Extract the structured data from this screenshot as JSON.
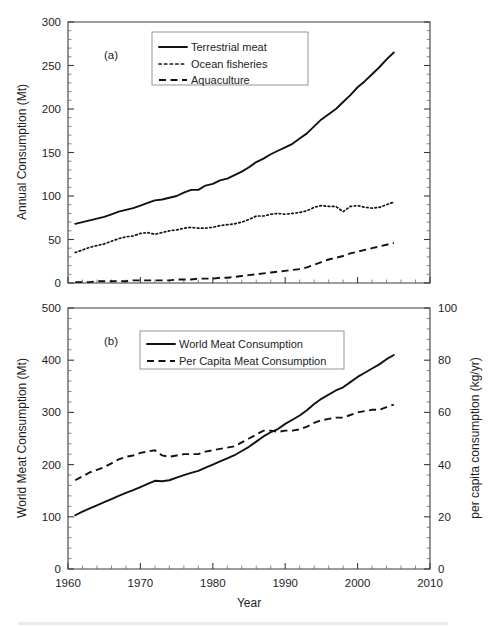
{
  "figure": {
    "width": 493,
    "height": 626,
    "background": "#ffffff",
    "ink_color": "#111111",
    "axis_color": "#3b3b3b"
  },
  "chart_data": [
    {
      "type": "line",
      "panel_label": "(a)",
      "title": "",
      "xlabel": "",
      "ylabel": "Annual Consumption (Mt)",
      "xlim": [
        1960,
        2010
      ],
      "ylim": [
        0,
        300
      ],
      "yticks": [
        0,
        50,
        100,
        150,
        200,
        250,
        300
      ],
      "ytick_labels": [
        "0",
        "50",
        "100",
        "150",
        "200",
        "250",
        "300"
      ],
      "xticks": [
        1960,
        1970,
        1980,
        1990,
        2000,
        2010
      ],
      "xtick_labels": [
        "",
        "",
        "",
        "",
        "",
        ""
      ],
      "minor_ticks": true,
      "grid": false,
      "legend_position": "upper-left-inset",
      "x": [
        1961,
        1962,
        1963,
        1964,
        1965,
        1966,
        1967,
        1968,
        1969,
        1970,
        1971,
        1972,
        1973,
        1974,
        1975,
        1976,
        1977,
        1978,
        1979,
        1980,
        1981,
        1982,
        1983,
        1984,
        1985,
        1986,
        1987,
        1988,
        1989,
        1990,
        1991,
        1992,
        1993,
        1994,
        1995,
        1996,
        1997,
        1998,
        1999,
        2000,
        2001,
        2002,
        2003,
        2004,
        2005
      ],
      "series": [
        {
          "name": "Terrestrial meat",
          "style": "solid",
          "values": [
            68,
            70,
            72,
            74,
            76,
            79,
            82,
            84,
            86,
            89,
            92,
            95,
            96,
            98,
            100,
            104,
            107,
            107,
            112,
            114,
            118,
            120,
            124,
            128,
            133,
            139,
            143,
            148,
            152,
            156,
            160,
            166,
            172,
            180,
            188,
            194,
            200,
            208,
            216,
            225,
            232,
            240,
            248,
            257,
            265
          ]
        },
        {
          "name": "Ocean fisheries",
          "style": "dotted",
          "values": [
            35,
            38,
            41,
            43,
            45,
            48,
            51,
            53,
            54,
            57,
            58,
            56,
            58,
            60,
            61,
            63,
            64,
            63,
            63,
            64,
            66,
            67,
            68,
            70,
            73,
            77,
            77,
            79,
            80,
            79,
            80,
            81,
            83,
            87,
            89,
            88,
            88,
            82,
            88,
            89,
            87,
            86,
            87,
            90,
            93
          ]
        },
        {
          "name": "Aquaculture",
          "style": "dashed",
          "values": [
            1,
            1,
            1,
            2,
            2,
            2,
            2,
            2,
            3,
            3,
            3,
            3,
            3,
            3,
            4,
            4,
            4,
            5,
            5,
            5,
            6,
            6,
            7,
            8,
            9,
            10,
            11,
            12,
            13,
            14,
            15,
            16,
            18,
            21,
            24,
            27,
            29,
            31,
            34,
            36,
            38,
            40,
            42,
            44,
            46
          ]
        }
      ]
    },
    {
      "type": "line",
      "panel_label": "(b)",
      "title": "",
      "xlabel": "Year",
      "ylabel": "World Meat Consumption (Mt)",
      "ylabel_right": "per capita consumption (kg/yr)",
      "xlim": [
        1960,
        2010
      ],
      "ylim": [
        0,
        500
      ],
      "ylim_right": [
        0,
        100
      ],
      "yticks": [
        0,
        100,
        200,
        300,
        400,
        500
      ],
      "ytick_labels": [
        "0",
        "100",
        "200",
        "300",
        "400",
        "500"
      ],
      "yticks_right": [
        0,
        20,
        40,
        60,
        80,
        100
      ],
      "ytick_labels_right": [
        "0",
        "20",
        "40",
        "60",
        "80",
        "100"
      ],
      "xticks": [
        1960,
        1970,
        1980,
        1990,
        2000,
        2010
      ],
      "xtick_labels": [
        "1960",
        "1970",
        "1980",
        "1990",
        "2000",
        "2010"
      ],
      "minor_ticks": true,
      "grid": false,
      "legend_position": "upper-center-inset",
      "x": [
        1961,
        1962,
        1963,
        1964,
        1965,
        1966,
        1967,
        1968,
        1969,
        1970,
        1971,
        1972,
        1973,
        1974,
        1975,
        1976,
        1977,
        1978,
        1979,
        1980,
        1981,
        1982,
        1983,
        1984,
        1985,
        1986,
        1987,
        1988,
        1989,
        1990,
        1991,
        1992,
        1993,
        1994,
        1995,
        1996,
        1997,
        1998,
        1999,
        2000,
        2001,
        2002,
        2003,
        2004,
        2005
      ],
      "series": [
        {
          "name": "World Meat Consumption",
          "style": "solid",
          "axis": "left",
          "values": [
            103,
            110,
            116,
            122,
            128,
            134,
            140,
            146,
            151,
            157,
            163,
            169,
            168,
            170,
            175,
            180,
            184,
            188,
            194,
            200,
            206,
            212,
            218,
            226,
            234,
            244,
            254,
            262,
            268,
            278,
            286,
            294,
            304,
            316,
            326,
            334,
            342,
            348,
            358,
            368,
            376,
            384,
            392,
            402,
            410
          ]
        },
        {
          "name": "Per Capita Meat Consumption",
          "style": "dashed",
          "axis": "right",
          "values": [
            34,
            35.5,
            37,
            38,
            39,
            40.5,
            42,
            43,
            43.5,
            44.5,
            45,
            45.5,
            43.5,
            43,
            43.5,
            44,
            44,
            44,
            45,
            45.5,
            46,
            46.5,
            47,
            48.5,
            50,
            51.5,
            53,
            53,
            52.5,
            53,
            53,
            53.5,
            54.5,
            56,
            57,
            57.5,
            58,
            58,
            59,
            60,
            60.5,
            61,
            61,
            62,
            63
          ]
        }
      ]
    }
  ]
}
